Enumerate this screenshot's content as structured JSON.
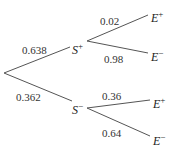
{
  "diagram": {
    "type": "probability-tree",
    "root": {
      "branches": [
        {
          "node": "S",
          "sign": "+",
          "probability": "0.638",
          "branches": [
            {
              "node": "E",
              "sign": "+",
              "probability": "0.02"
            },
            {
              "node": "E",
              "sign": "−",
              "probability": "0.98"
            }
          ]
        },
        {
          "node": "S",
          "sign": "−",
          "probability": "0.362",
          "branches": [
            {
              "node": "E",
              "sign": "+",
              "probability": "0.36"
            },
            {
              "node": "E",
              "sign": "−",
              "probability": "0.64"
            }
          ]
        }
      ]
    }
  },
  "colors": {
    "line": "#555555",
    "text": "#222222",
    "background": "#ffffff"
  }
}
